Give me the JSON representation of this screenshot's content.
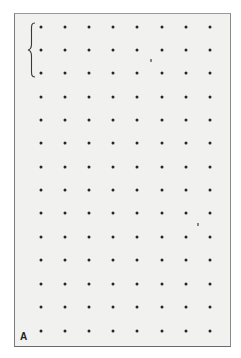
{
  "figure": {
    "label": "A",
    "grid": {
      "rows": 14,
      "columns": 8,
      "dot_color": "#262626",
      "background_color": "#f1f1f0",
      "column_x": [
        41,
        65,
        89,
        113,
        137,
        162,
        186,
        210
      ],
      "row_y": [
        27,
        50,
        73,
        97,
        120,
        143,
        167,
        190,
        213,
        237,
        260,
        284,
        307,
        331
      ]
    },
    "brace": {
      "side": "left",
      "spans_rows": [
        1,
        3
      ]
    }
  }
}
